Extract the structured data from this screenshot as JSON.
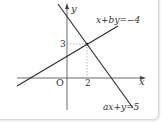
{
  "diagram": {
    "type": "coordinate-graph",
    "axes": {
      "x_label": "x",
      "y_label": "y",
      "origin_label": "O"
    },
    "intersection": {
      "x_value": "2",
      "y_value": "3"
    },
    "lines": [
      {
        "equation": "x+by=−4"
      },
      {
        "equation": "ax+y=5"
      }
    ],
    "colors": {
      "line": "#2b2b2b",
      "axis": "#444444",
      "dashed": "#999999"
    }
  }
}
